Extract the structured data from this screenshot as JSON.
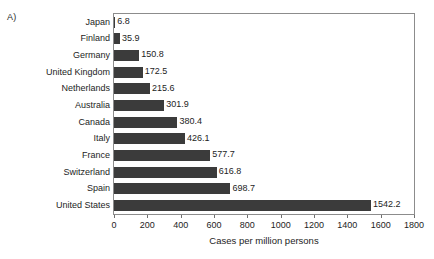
{
  "figure": {
    "panel_letter": "A)",
    "background_color": "#ffffff",
    "frame_color": "#8c8c8c",
    "bar_color": "#3b3b3b",
    "text_color": "#1d1d1d"
  },
  "chart_data": {
    "type": "bar",
    "orientation": "horizontal",
    "title": "",
    "subtitle": "",
    "xlabel": "Cases per million persons",
    "ylabel": "",
    "xlim": [
      0,
      1800
    ],
    "xticks": [
      0,
      200,
      400,
      600,
      800,
      1000,
      1200,
      1400,
      1600,
      1800
    ],
    "xtick_labels": [
      "0",
      "200",
      "400",
      "600",
      "800",
      "1000",
      "1200",
      "1400",
      "1600",
      "1800"
    ],
    "grid": false,
    "legend": false,
    "legend_position": "none",
    "data_labels": true,
    "categories": [
      "Japan",
      "Finland",
      "Germany",
      "United Kingdom",
      "Netherlands",
      "Australia",
      "Canada",
      "Italy",
      "France",
      "Switzerland",
      "Spain",
      "United States"
    ],
    "values": [
      6.8,
      35.9,
      150.8,
      172.5,
      215.6,
      301.9,
      380.4,
      426.1,
      577.7,
      616.8,
      698.7,
      1542.2
    ],
    "value_labels": [
      "6.8",
      "35.9",
      "150.8",
      "172.5",
      "215.6",
      "301.9",
      "380.4",
      "426.1",
      "577.7",
      "616.8",
      "698.7",
      "1542.2"
    ]
  }
}
